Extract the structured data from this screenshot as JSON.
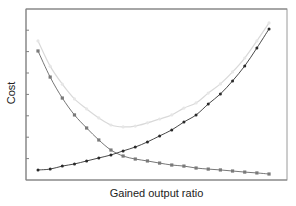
{
  "chart_data": {
    "type": "line",
    "title": "",
    "xlabel": "Gained output ratio",
    "ylabel": "Cost",
    "x_ticks_labeled": false,
    "y_ticks_labeled": false,
    "ylim": [
      0,
      8
    ],
    "grid": false,
    "legend": null,
    "x": [
      1,
      2,
      3,
      4,
      5,
      6,
      7,
      8,
      9,
      10,
      11,
      12,
      13,
      14,
      15,
      16,
      17,
      18,
      19,
      20
    ],
    "series": [
      {
        "name": "Increasing cost",
        "color": "#333333",
        "marker": "dot",
        "values": [
          0.47,
          0.51,
          0.65,
          0.75,
          0.89,
          1.03,
          1.17,
          1.36,
          1.54,
          1.78,
          2.06,
          2.34,
          2.71,
          3.04,
          3.55,
          4.02,
          4.63,
          5.33,
          6.17,
          7.06
        ]
      },
      {
        "name": "Decreasing cost",
        "color": "#666666",
        "marker": "square",
        "values": [
          6.03,
          4.81,
          3.83,
          3.04,
          2.43,
          1.87,
          1.4,
          1.12,
          0.98,
          0.89,
          0.79,
          0.7,
          0.65,
          0.56,
          0.51,
          0.47,
          0.42,
          0.37,
          0.33,
          0.28
        ]
      },
      {
        "name": "Total cost",
        "color": "#d9d9d9",
        "marker": "dot",
        "values": [
          6.5,
          5.32,
          4.48,
          3.79,
          3.32,
          2.9,
          2.57,
          2.48,
          2.52,
          2.67,
          2.85,
          3.04,
          3.36,
          3.6,
          4.06,
          4.49,
          5.05,
          5.7,
          6.5,
          7.34
        ]
      }
    ]
  }
}
